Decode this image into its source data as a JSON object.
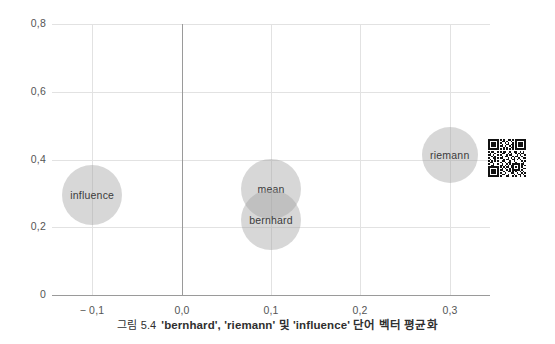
{
  "figure": {
    "caption_number": "그림 5.4",
    "caption_text": "'bernhard', 'riemann' 및 'influence' 단어 벡터 평균화",
    "qr_code_name": "qr-code"
  },
  "chart_data": {
    "type": "scatter",
    "title": "",
    "subtitle": "",
    "xlabel": "",
    "ylabel": "",
    "xlim": [
      -0.145,
      0.345
    ],
    "ylim": [
      0.0,
      0.8
    ],
    "grid": true,
    "legend": "none",
    "xticks": [
      -0.1,
      0.0,
      0.1,
      0.2,
      0.3
    ],
    "xticklabels": [
      "− 0,1",
      "0,0",
      "0,1",
      "0,2",
      "0,3"
    ],
    "yticks": [
      0.0,
      0.2,
      0.4,
      0.6,
      0.8
    ],
    "yticklabels": [
      "0",
      "0,2",
      "0,4",
      "0,6",
      "0,8"
    ],
    "marker_color": "#a0a0a0",
    "marker_opacity": 0.42,
    "points": [
      {
        "label": "influence",
        "x": -0.1,
        "y": 0.296,
        "r_px": 30
      },
      {
        "label": "mean",
        "x": 0.1,
        "y": 0.312,
        "r_px": 30
      },
      {
        "label": "bernhard",
        "x": 0.1,
        "y": 0.222,
        "r_px": 30
      },
      {
        "label": "riemann",
        "x": 0.3,
        "y": 0.412,
        "r_px": 28
      }
    ]
  }
}
